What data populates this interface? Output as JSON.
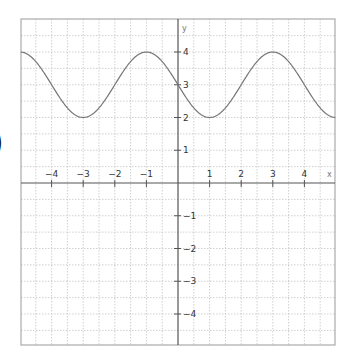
{
  "page": {
    "left_fragment": ")"
  },
  "chart_data": {
    "type": "line",
    "title": "",
    "xlabel": "x",
    "ylabel": "y",
    "xlim": [
      -5,
      5
    ],
    "ylim": [
      -5,
      5
    ],
    "grid": true,
    "grid_step": 0.5,
    "x_ticks": [
      -4,
      -3,
      -2,
      -1,
      1,
      2,
      3,
      4
    ],
    "y_ticks": [
      -4,
      -3,
      -2,
      -1,
      1,
      2,
      3,
      4
    ],
    "x_tick_labels": [
      "−4",
      "−3",
      "−2",
      "−1",
      "1",
      "2",
      "3",
      "4"
    ],
    "y_tick_labels": [
      "−4",
      "−3",
      "−2",
      "−1",
      "1",
      "2",
      "3",
      "4"
    ],
    "series": [
      {
        "name": "y = 3 + cos(π(x+1)/2)",
        "function": {
          "amplitude": 1,
          "midline": 3,
          "period": 4,
          "phase_shift": -1
        },
        "color": "#777777",
        "x": [
          -5,
          -4.5,
          -4,
          -3.5,
          -3,
          -2.5,
          -2,
          -1.5,
          -1,
          -0.5,
          0,
          0.5,
          1,
          1.5,
          2,
          2.5,
          3,
          3.5,
          4,
          4.5,
          5
        ],
        "values": [
          4,
          3.71,
          3,
          2.29,
          2,
          2.29,
          3,
          3.71,
          4,
          3.71,
          3,
          2.29,
          2,
          2.29,
          3,
          3.71,
          4,
          3.71,
          3,
          2.29,
          2
        ]
      }
    ],
    "colors": {
      "axis": "#555555",
      "grid": "#bbbbbb",
      "frame": "#999999",
      "curve": "#777777"
    }
  }
}
